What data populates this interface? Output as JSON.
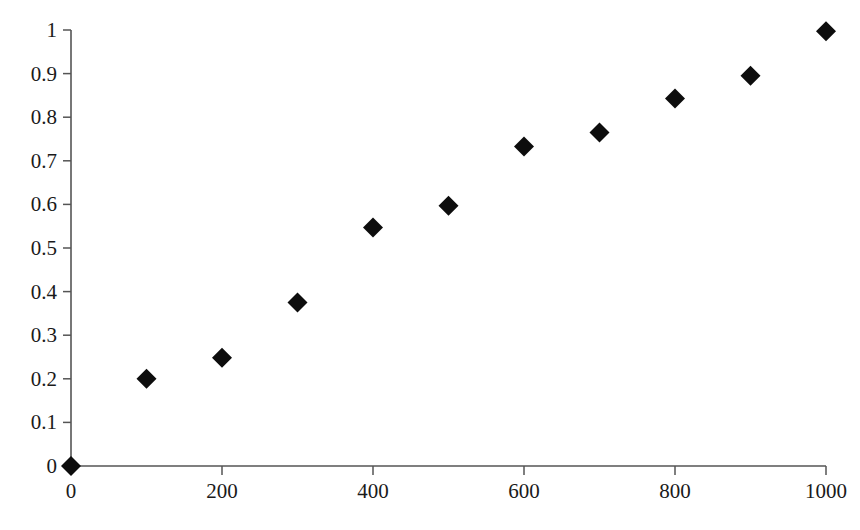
{
  "chart_data": {
    "type": "scatter",
    "title": "",
    "subtitle": "",
    "xlabel": "",
    "ylabel": "",
    "xlim": [
      0,
      1000
    ],
    "ylim": [
      0,
      1
    ],
    "grid": false,
    "legend": null,
    "marker": {
      "shape": "diamond",
      "color": "#0d0d0d",
      "size_px": 20
    },
    "x": [
      0,
      100,
      200,
      300,
      400,
      500,
      600,
      700,
      800,
      900,
      1000
    ],
    "values": [
      0,
      0.2,
      0.248,
      0.375,
      0.547,
      0.597,
      0.733,
      0.765,
      0.843,
      0.895,
      0.997
    ],
    "series": [
      {
        "name": "",
        "points": [
          {
            "x": 0,
            "y": 0
          },
          {
            "x": 100,
            "y": 0.2
          },
          {
            "x": 200,
            "y": 0.248
          },
          {
            "x": 300,
            "y": 0.375
          },
          {
            "x": 400,
            "y": 0.547
          },
          {
            "x": 500,
            "y": 0.597
          },
          {
            "x": 600,
            "y": 0.733
          },
          {
            "x": 700,
            "y": 0.765
          },
          {
            "x": 800,
            "y": 0.843
          },
          {
            "x": 900,
            "y": 0.895
          },
          {
            "x": 1000,
            "y": 0.997
          }
        ]
      }
    ],
    "x_ticks": [
      {
        "value": 0,
        "label": "0",
        "major": true
      },
      {
        "value": 100,
        "label": "",
        "major": false
      },
      {
        "value": 200,
        "label": "200",
        "major": true
      },
      {
        "value": 300,
        "label": "",
        "major": false
      },
      {
        "value": 400,
        "label": "400",
        "major": true
      },
      {
        "value": 500,
        "label": "",
        "major": false
      },
      {
        "value": 600,
        "label": "600",
        "major": true
      },
      {
        "value": 700,
        "label": "",
        "major": false
      },
      {
        "value": 800,
        "label": "800",
        "major": true
      },
      {
        "value": 900,
        "label": "",
        "major": false
      },
      {
        "value": 1000,
        "label": "1000",
        "major": true
      }
    ],
    "y_ticks": [
      {
        "value": 0,
        "label": "0"
      },
      {
        "value": 0.1,
        "label": "0.1"
      },
      {
        "value": 0.2,
        "label": "0.2"
      },
      {
        "value": 0.3,
        "label": "0.3"
      },
      {
        "value": 0.4,
        "label": "0.4"
      },
      {
        "value": 0.5,
        "label": "0.5"
      },
      {
        "value": 0.6,
        "label": "0.6"
      },
      {
        "value": 0.7,
        "label": "0.7"
      },
      {
        "value": 0.8,
        "label": "0.8"
      },
      {
        "value": 0.9,
        "label": "0.9"
      },
      {
        "value": 1,
        "label": "1"
      }
    ],
    "colors": {
      "marker": "#0d0d0d",
      "axis": "#555555",
      "text": "#1a1a1a",
      "background": "#ffffff"
    }
  }
}
